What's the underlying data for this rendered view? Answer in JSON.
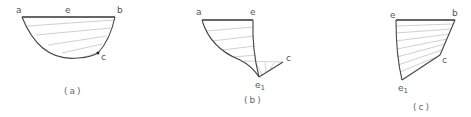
{
  "figures": [
    {
      "id": "a",
      "caption": "(a)",
      "labels": {
        "a": "a",
        "e": "e",
        "b": "b",
        "c": "c"
      },
      "points": {
        "a": [
          22,
          17
        ],
        "b": [
          115,
          17
        ],
        "c": [
          98,
          53
        ],
        "bottom": [
          78,
          58
        ]
      }
    },
    {
      "id": "b",
      "caption": "(b)",
      "labels": {
        "a": "a",
        "e": "e",
        "c": "c",
        "e1": "e",
        "e1_sub": "1"
      },
      "points": {
        "a": [
          202,
          20
        ],
        "e": [
          253,
          20
        ],
        "e1": [
          259,
          77
        ],
        "c": [
          283,
          62
        ]
      }
    },
    {
      "id": "c",
      "caption": "(c)",
      "labels": {
        "e": "e",
        "b": "b",
        "c": "c",
        "e1": "e",
        "e1_sub": "1"
      },
      "points": {
        "e": [
          396,
          20
        ],
        "b": [
          455,
          20
        ],
        "c": [
          440,
          55
        ],
        "e1": [
          402,
          80
        ]
      }
    }
  ],
  "colors": {
    "line": "#444444",
    "hatch": "#bbbbbb",
    "label": "#555555"
  }
}
